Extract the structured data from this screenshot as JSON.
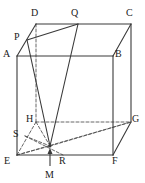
{
  "figure": {
    "kind": "geometry-diagram",
    "shape": "oblique-cuboid",
    "caption": "",
    "stroke_color": "#3a3a3a",
    "hidden_stroke_color": "#555555",
    "label_color": "#1a1a1a",
    "background": "#ffffff",
    "solid_stroke_width": 1.1,
    "dashed_stroke_width": 0.9,
    "dash_pattern": "3,2"
  },
  "vertices": [
    {
      "id": "A",
      "label": "A",
      "x": 17,
      "y": 56,
      "label_x": 3,
      "label_y": 49,
      "hidden": false
    },
    {
      "id": "B",
      "label": "B",
      "x": 113,
      "y": 56,
      "label_x": 115,
      "label_y": 49,
      "hidden": false
    },
    {
      "id": "C",
      "label": "C",
      "x": 131,
      "y": 24,
      "label_x": 126,
      "label_y": 8,
      "hidden": false
    },
    {
      "id": "D",
      "label": "D",
      "x": 36,
      "y": 24,
      "label_x": 31,
      "label_y": 8,
      "hidden": false
    },
    {
      "id": "E",
      "label": "E",
      "x": 17,
      "y": 155,
      "label_x": 4,
      "label_y": 156,
      "hidden": false
    },
    {
      "id": "F",
      "label": "F",
      "x": 113,
      "y": 155,
      "label_x": 112,
      "label_y": 156,
      "hidden": false
    },
    {
      "id": "G",
      "label": "G",
      "x": 131,
      "y": 122,
      "label_x": 132,
      "label_y": 114,
      "hidden": false
    },
    {
      "id": "H",
      "label": "H",
      "x": 36,
      "y": 122,
      "label_x": 26,
      "label_y": 114,
      "hidden": true
    }
  ],
  "marked_points": [
    {
      "id": "P",
      "label": "P",
      "x": 27,
      "y": 40,
      "label_x": 14,
      "label_y": 32,
      "on": "AD"
    },
    {
      "id": "Q",
      "label": "Q",
      "x": 78,
      "y": 24,
      "label_x": 71,
      "label_y": 8,
      "on": "DC"
    },
    {
      "id": "S",
      "label": "S",
      "x": 25,
      "y": 136,
      "label_x": 13,
      "label_y": 129,
      "on": "EH"
    },
    {
      "id": "R",
      "label": "R",
      "x": 63,
      "y": 155,
      "label_x": 59,
      "label_y": 156,
      "on": "EF"
    },
    {
      "id": "M",
      "label": "M",
      "x": 50,
      "y": 146,
      "label_x": 45,
      "label_y": 170,
      "on": "base-interior"
    }
  ],
  "solid_edges": [
    {
      "from": "A",
      "to": "B"
    },
    {
      "from": "A",
      "to": "D"
    },
    {
      "from": "D",
      "to": "C"
    },
    {
      "from": "C",
      "to": "B"
    },
    {
      "from": "A",
      "to": "E"
    },
    {
      "from": "B",
      "to": "F"
    },
    {
      "from": "C",
      "to": "G"
    },
    {
      "from": "E",
      "to": "F"
    },
    {
      "from": "F",
      "to": "G"
    }
  ],
  "hidden_edges": [
    {
      "from": "D",
      "to": "H"
    },
    {
      "from": "E",
      "to": "H"
    },
    {
      "from": "H",
      "to": "G"
    }
  ],
  "solid_construction_lines": [
    {
      "from": "P",
      "to": "Q"
    },
    {
      "from": "P",
      "to": "M"
    },
    {
      "from": "Q",
      "to": "M"
    }
  ],
  "hidden_construction_lines": [
    {
      "from": "E",
      "to": "G"
    },
    {
      "from": "E",
      "to": "M"
    },
    {
      "from": "S",
      "to": "M"
    },
    {
      "from": "H",
      "to": "M"
    },
    {
      "from": "M",
      "to": "G"
    },
    {
      "from": "S",
      "to": "R"
    }
  ],
  "arrow": {
    "id": "arrow-to-M",
    "from_x": 50,
    "from_y": 166,
    "to_x": 50,
    "to_y": 148,
    "head_width": 5,
    "head_length": 6
  }
}
